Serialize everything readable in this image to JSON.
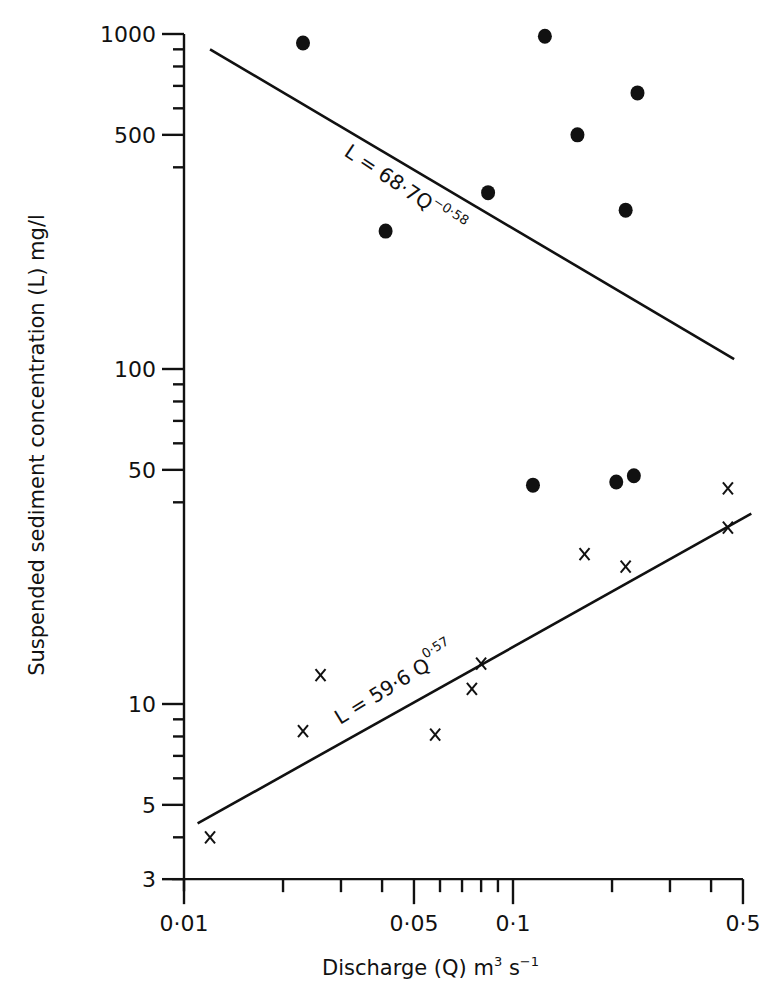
{
  "chart_data": {
    "type": "scatter",
    "title": "",
    "xlabel": "Discharge (Q) m³ s⁻¹",
    "ylabel": "Suspended sediment concentration (L) mg/l",
    "xscale": "log",
    "yscale": "log",
    "xlim": [
      0.01,
      0.5
    ],
    "ylim": [
      3,
      1000
    ],
    "grid": false,
    "legend": null,
    "x_ticks": [
      {
        "value": 0.01,
        "label": "0·01"
      },
      {
        "value": 0.05,
        "label": "0·05"
      },
      {
        "value": 0.1,
        "label": "0·1"
      },
      {
        "value": 0.5,
        "label": "0·5"
      }
    ],
    "x_minor_ticks": [
      0.02,
      0.03,
      0.04,
      0.06,
      0.07,
      0.08,
      0.09,
      0.2,
      0.3,
      0.4
    ],
    "y_ticks": [
      {
        "value": 1000,
        "label": "1000"
      },
      {
        "value": 500,
        "label": "500"
      },
      {
        "value": 100,
        "label": "100"
      },
      {
        "value": 50,
        "label": "50"
      },
      {
        "value": 10,
        "label": "10"
      },
      {
        "value": 5,
        "label": "5"
      },
      {
        "value": 3,
        "label": "3"
      }
    ],
    "y_minor_ticks": [
      900,
      800,
      700,
      600,
      400,
      90,
      80,
      70,
      60,
      40,
      9,
      8,
      7,
      6,
      4
    ],
    "series": [
      {
        "name": "dots",
        "marker": "filled-circle",
        "points": [
          {
            "x": 0.023,
            "y": 940
          },
          {
            "x": 0.125,
            "y": 985
          },
          {
            "x": 0.239,
            "y": 667
          },
          {
            "x": 0.157,
            "y": 500
          },
          {
            "x": 0.084,
            "y": 336
          },
          {
            "x": 0.22,
            "y": 298
          },
          {
            "x": 0.041,
            "y": 258
          },
          {
            "x": 0.115,
            "y": 45
          },
          {
            "x": 0.206,
            "y": 46
          },
          {
            "x": 0.233,
            "y": 48
          }
        ]
      },
      {
        "name": "crosses",
        "marker": "x",
        "points": [
          {
            "x": 0.012,
            "y": 4.0
          },
          {
            "x": 0.023,
            "y": 8.3
          },
          {
            "x": 0.026,
            "y": 12.2
          },
          {
            "x": 0.058,
            "y": 8.1
          },
          {
            "x": 0.075,
            "y": 11.1
          },
          {
            "x": 0.08,
            "y": 13.2
          },
          {
            "x": 0.165,
            "y": 28
          },
          {
            "x": 0.22,
            "y": 25.7
          },
          {
            "x": 0.45,
            "y": 33.6
          },
          {
            "x": 0.45,
            "y": 44
          }
        ]
      }
    ],
    "regression_lines": [
      {
        "name": "upper-fit",
        "equation_main": "L = 68·7Q",
        "equation_exponent": "−0·58",
        "x_range": [
          0.012,
          0.47
        ],
        "y_range": [
          900,
          107
        ]
      },
      {
        "name": "lower-fit",
        "equation_main": "L = 59·6 Q",
        "equation_exponent": "0·57",
        "x_range": [
          0.011,
          0.53
        ],
        "y_range": [
          4.4,
          37
        ]
      }
    ]
  },
  "labels": {
    "x_axis_title_main": "Discharge (Q) m",
    "x_axis_title_sup1": "3",
    "x_axis_title_mid": " s",
    "x_axis_title_sup2": "−1",
    "y_axis_title": "Suspended sediment concentration (L) mg/l",
    "upper_eq_main": "L = 68·7Q",
    "upper_eq_sup": "−0·58",
    "lower_eq_main": "L = 59·6 Q",
    "lower_eq_sup": "0·57"
  }
}
